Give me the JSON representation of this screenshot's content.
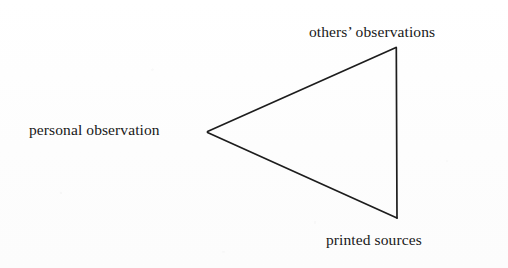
{
  "figure": {
    "type": "triangle-diagram",
    "background_color": "#fefefe",
    "stroke_color": "#1d1d1d",
    "text_color": "#181818",
    "vertices": [
      {
        "id": "left",
        "x": 207,
        "y": 132,
        "label_key": "personal"
      },
      {
        "id": "top-right",
        "x": 396,
        "y": 47,
        "label_key": "others"
      },
      {
        "id": "bottom-right",
        "x": 397,
        "y": 218,
        "label_key": "printed"
      }
    ],
    "labels": {
      "personal": "personal observation",
      "others": "others’ observations",
      "printed": "printed sources"
    }
  }
}
